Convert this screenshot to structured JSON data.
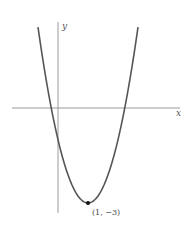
{
  "chart_data": {
    "type": "line",
    "title": "",
    "function": "y = 2(x - 1)^2 - 3",
    "xlabel": "x",
    "ylabel": "y",
    "grid": false,
    "legend": null,
    "annotations": [
      {
        "point": [
          1,
          -3
        ],
        "label": "(1, −3)",
        "marker": "filled-dot"
      }
    ],
    "vertex": [
      1,
      -3
    ],
    "approx_x_intercepts": [
      -0.22,
      2.22
    ],
    "approx_y_intercept": -1,
    "xlim": [
      -1.5,
      4.1
    ],
    "ylim": [
      -3.3,
      2.7
    ],
    "x": [
      -0.75,
      -0.5,
      -0.22,
      0,
      0.5,
      1,
      1.5,
      2,
      2.22,
      2.5,
      2.75
    ],
    "y": [
      3.13,
      1.5,
      0,
      -1,
      -2.5,
      -3,
      -2.5,
      -1,
      0,
      1.5,
      3.13
    ],
    "colors": {
      "curve": "#555555",
      "axes": "#999999",
      "point": "#111111"
    }
  },
  "labels": {
    "x_axis": "x",
    "y_axis": "y",
    "vertex": "(1, −3)"
  }
}
